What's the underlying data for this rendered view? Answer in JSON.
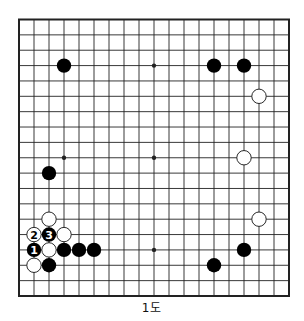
{
  "diagram": {
    "type": "go-board",
    "size": 19,
    "caption": "1도",
    "colors": {
      "line": "#222222",
      "black": "#000000",
      "white": "#ffffff",
      "background": "#ffffff"
    },
    "star_points": [
      [
        3,
        3
      ],
      [
        9,
        3
      ],
      [
        15,
        3
      ],
      [
        3,
        9
      ],
      [
        9,
        9
      ],
      [
        15,
        9
      ],
      [
        3,
        15
      ],
      [
        9,
        15
      ],
      [
        15,
        15
      ]
    ],
    "stones": [
      {
        "col": 3,
        "row": 3,
        "color": "black"
      },
      {
        "col": 13,
        "row": 3,
        "color": "black"
      },
      {
        "col": 15,
        "row": 3,
        "color": "black"
      },
      {
        "col": 16,
        "row": 5,
        "color": "white"
      },
      {
        "col": 15,
        "row": 9,
        "color": "white"
      },
      {
        "col": 2,
        "row": 10,
        "color": "black"
      },
      {
        "col": 16,
        "row": 13,
        "color": "white"
      },
      {
        "col": 2,
        "row": 13,
        "color": "white"
      },
      {
        "col": 1,
        "row": 14,
        "color": "white",
        "label": "2"
      },
      {
        "col": 2,
        "row": 14,
        "color": "black",
        "label": "3"
      },
      {
        "col": 3,
        "row": 14,
        "color": "white"
      },
      {
        "col": 1,
        "row": 15,
        "color": "black",
        "label": "1"
      },
      {
        "col": 2,
        "row": 15,
        "color": "white"
      },
      {
        "col": 3,
        "row": 15,
        "color": "black"
      },
      {
        "col": 4,
        "row": 15,
        "color": "black"
      },
      {
        "col": 5,
        "row": 15,
        "color": "black"
      },
      {
        "col": 15,
        "row": 15,
        "color": "black"
      },
      {
        "col": 1,
        "row": 16,
        "color": "white"
      },
      {
        "col": 2,
        "row": 16,
        "color": "black"
      },
      {
        "col": 13,
        "row": 16,
        "color": "black"
      }
    ]
  }
}
